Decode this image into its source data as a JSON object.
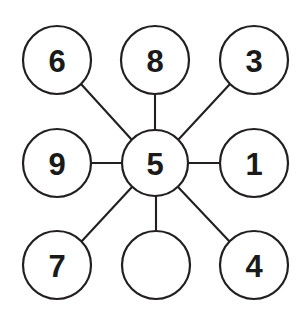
{
  "figure": {
    "type": "node-link-diagram",
    "width": 302,
    "height": 315,
    "background_color": "#ffffff",
    "stroke_color": "#231f20",
    "label_color": "#1a1a1a",
    "circle_fill": "#ffffff",
    "circle_diameter": 68,
    "stroke_width": 2
  },
  "nodes": [
    {
      "id": "node-top-left",
      "label": "6",
      "cx": 57,
      "cy": 60,
      "r": 34,
      "position": "top-left",
      "empty": false
    },
    {
      "id": "node-top-center",
      "label": "8",
      "cx": 155,
      "cy": 60,
      "r": 34,
      "position": "top-center",
      "empty": false
    },
    {
      "id": "node-top-right",
      "label": "3",
      "cx": 254,
      "cy": 60,
      "r": 34,
      "position": "top-right",
      "empty": false
    },
    {
      "id": "node-middle-left",
      "label": "9",
      "cx": 57,
      "cy": 163,
      "r": 34,
      "position": "middle-left",
      "empty": false
    },
    {
      "id": "node-center",
      "label": "5",
      "cx": 155,
      "cy": 163,
      "r": 33,
      "position": "center",
      "empty": false
    },
    {
      "id": "node-middle-right",
      "label": "1",
      "cx": 254,
      "cy": 163,
      "r": 34,
      "position": "middle-right",
      "empty": false
    },
    {
      "id": "node-bottom-left",
      "label": "7",
      "cx": 57,
      "cy": 265,
      "r": 34,
      "position": "bottom-left",
      "empty": false
    },
    {
      "id": "node-bottom-center",
      "label": "",
      "cx": 156,
      "cy": 265,
      "r": 34,
      "position": "bottom-center",
      "empty": true
    },
    {
      "id": "node-bottom-right",
      "label": "4",
      "cx": 254,
      "cy": 265,
      "r": 34,
      "position": "bottom-right",
      "empty": false
    }
  ],
  "edges": [
    {
      "id": "edge-center-top-left",
      "from": "node-center",
      "to": "node-top-left",
      "x1": 132,
      "y1": 140,
      "x2": 81,
      "y2": 84
    },
    {
      "id": "edge-center-top-center",
      "from": "node-center",
      "to": "node-top-center",
      "x1": 155,
      "y1": 130,
      "x2": 155,
      "y2": 94
    },
    {
      "id": "edge-center-top-right",
      "from": "node-center",
      "to": "node-top-right",
      "x1": 178,
      "y1": 140,
      "x2": 230,
      "y2": 84
    },
    {
      "id": "edge-center-middle-left",
      "from": "node-center",
      "to": "node-middle-left",
      "x1": 122,
      "y1": 163,
      "x2": 91,
      "y2": 163
    },
    {
      "id": "edge-center-middle-right",
      "from": "node-center",
      "to": "node-middle-right",
      "x1": 188,
      "y1": 163,
      "x2": 220,
      "y2": 163
    },
    {
      "id": "edge-center-bottom-left",
      "from": "node-center",
      "to": "node-bottom-left",
      "x1": 132,
      "y1": 187,
      "x2": 81,
      "y2": 242
    },
    {
      "id": "edge-center-bottom-center",
      "from": "node-center",
      "to": "node-bottom-center",
      "x1": 156,
      "y1": 196,
      "x2": 156,
      "y2": 231
    },
    {
      "id": "edge-center-bottom-right",
      "from": "node-center",
      "to": "node-bottom-right",
      "x1": 178,
      "y1": 187,
      "x2": 230,
      "y2": 242
    }
  ]
}
